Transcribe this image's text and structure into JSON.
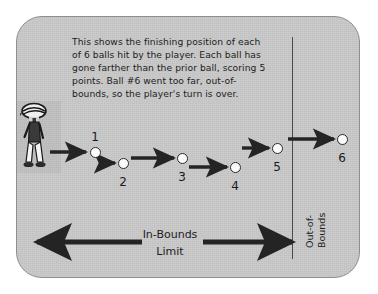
{
  "diagram": {
    "panel_color": "#c9c9c9",
    "panel_border_color": "#8e8e8e",
    "ink_color": "#1d1d1d",
    "description": "This shows the finishing position of each\nof 6 balls hit by the player. Each ball has\ngone farther than the prior ball, scoring 5\npoints. Ball #6 went too far, out-of-\nbounds, so the player's turn is over.",
    "player": {
      "label": "player-figure"
    },
    "boundary": {
      "name": "in-bounds-limit-line",
      "oob_line1": "Out-of-",
      "oob_line2": "Bounds"
    },
    "axis_label": {
      "line1": "In-Bounds",
      "line2": "Limit"
    },
    "balls": [
      {
        "number": "1",
        "cx": 95,
        "cy": 152,
        "in_bounds": true
      },
      {
        "number": "2",
        "cx": 123,
        "cy": 163,
        "in_bounds": true
      },
      {
        "number": "3",
        "cx": 182,
        "cy": 158,
        "in_bounds": true
      },
      {
        "number": "4",
        "cx": 235,
        "cy": 167,
        "in_bounds": true
      },
      {
        "number": "5",
        "cx": 277,
        "cy": 148,
        "in_bounds": true
      },
      {
        "number": "6",
        "cx": 342,
        "cy": 139,
        "in_bounds": false
      }
    ],
    "shot_arrows": [
      {
        "name": "shot-arrow-1",
        "x1": 50,
        "y1": 152,
        "x2": 86,
        "y2": 152
      },
      {
        "name": "shot-arrow-2",
        "x1": 100,
        "y1": 163,
        "x2": 115,
        "y2": 163
      },
      {
        "name": "shot-arrow-3",
        "x1": 131,
        "y1": 158,
        "x2": 174,
        "y2": 158
      },
      {
        "name": "shot-arrow-4",
        "x1": 189,
        "y1": 167,
        "x2": 227,
        "y2": 167
      },
      {
        "name": "shot-arrow-5",
        "x1": 242,
        "y1": 148,
        "x2": 269,
        "y2": 148
      },
      {
        "name": "shot-arrow-6",
        "x1": 288,
        "y1": 139,
        "x2": 334,
        "y2": 139
      }
    ],
    "limit_arrows": [
      {
        "name": "in-bounds-arrow-left",
        "x1": 142,
        "y1": 242,
        "x2": 37,
        "y2": 242
      },
      {
        "name": "in-bounds-arrow-right",
        "x1": 203,
        "y1": 242,
        "x2": 292,
        "y2": 242
      }
    ]
  }
}
